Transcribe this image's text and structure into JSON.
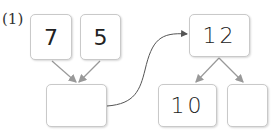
{
  "problem_label": "(1)",
  "boxes": {
    "top_left": "7",
    "top_right": "5",
    "sum": "",
    "result": "12",
    "split_left": "10",
    "split_right": ""
  },
  "colors": {
    "border": "#c9c9c9",
    "arrow": "#999999",
    "curve": "#555555"
  }
}
